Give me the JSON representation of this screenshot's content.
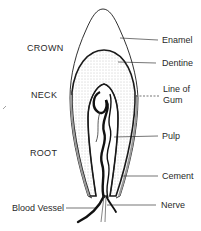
{
  "diagram": {
    "regions": [
      {
        "id": "crown",
        "label": "CROWN"
      },
      {
        "id": "neck",
        "label": "NECK"
      },
      {
        "id": "root",
        "label": "ROOT"
      }
    ],
    "parts_right": [
      {
        "id": "enamel",
        "label": "Enamel"
      },
      {
        "id": "dentine",
        "label": "Dentine"
      },
      {
        "id": "gum_line",
        "label_line1": "Line of",
        "label_line2": "Gum"
      },
      {
        "id": "pulp",
        "label": "Pulp"
      },
      {
        "id": "cement",
        "label": "Cement"
      },
      {
        "id": "nerve",
        "label": "Nerve"
      }
    ],
    "parts_left": [
      {
        "id": "blood_vessel",
        "label": "Blood Vessel"
      }
    ],
    "colors": {
      "line": "#1a1a1a",
      "text": "#2a2a2a",
      "stipple": "#8a8a8a",
      "background": "#ffffff"
    }
  }
}
